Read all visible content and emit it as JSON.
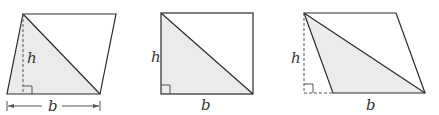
{
  "colors": {
    "stroke": "#2a2a2a",
    "fill": "#ebebeb",
    "dash": "#555555",
    "background": "#ffffff"
  },
  "figures": [
    {
      "name": "parallelogram-leaning-right",
      "height_label": "h",
      "base_label": "b",
      "has_base_arrows": true
    },
    {
      "name": "rectangle",
      "height_label": "h",
      "base_label": "b",
      "has_base_arrows": false
    },
    {
      "name": "parallelogram-leaning-left",
      "height_label": "h",
      "base_label": "b",
      "has_base_arrows": false
    }
  ]
}
